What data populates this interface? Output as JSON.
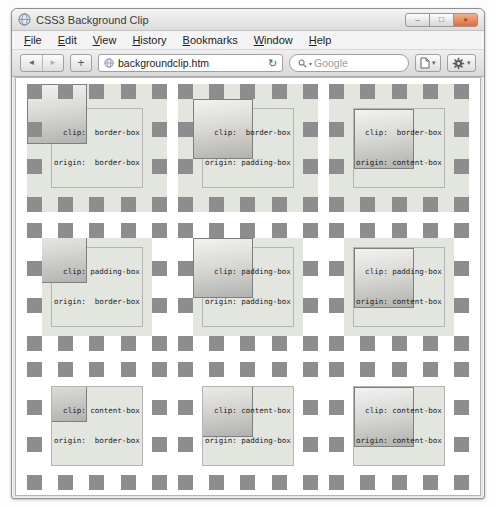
{
  "window": {
    "title": "CSS3 Background Clip",
    "controls": {
      "minimize": "–",
      "maximize": "□",
      "close": "×"
    }
  },
  "menubar": {
    "items": [
      "File",
      "Edit",
      "View",
      "History",
      "Bookmarks",
      "Window",
      "Help"
    ]
  },
  "toolbar": {
    "back_icon": "◄",
    "forward_icon": "►",
    "new_tab_label": "+",
    "url": "backgroundclip.htm",
    "reload_icon": "↻",
    "search_placeholder": "Google",
    "search_dropdown_icon": "▾",
    "page_menu_dropdown_icon": "▾",
    "settings_menu_dropdown_icon": "▾"
  },
  "demos": [
    {
      "clip": "border-box",
      "origin": "border-box",
      "label_line1": "  clip:  border-box",
      "label_line2": "origin:  border-box"
    },
    {
      "clip": "border-box",
      "origin": "padding-box",
      "label_line1": "  clip:  border-box",
      "label_line2": "origin: padding-box"
    },
    {
      "clip": "border-box",
      "origin": "content-box",
      "label_line1": "  clip:  border-box",
      "label_line2": "origin: content-box"
    },
    {
      "clip": "padding-box",
      "origin": "border-box",
      "label_line1": "  clip: padding-box",
      "label_line2": "origin:  border-box"
    },
    {
      "clip": "padding-box",
      "origin": "padding-box",
      "label_line1": "  clip: padding-box",
      "label_line2": "origin: padding-box"
    },
    {
      "clip": "padding-box",
      "origin": "content-box",
      "label_line1": "  clip: padding-box",
      "label_line2": "origin: content-box"
    },
    {
      "clip": "content-box",
      "origin": "border-box",
      "label_line1": "  clip: content-box",
      "label_line2": "origin:  border-box"
    },
    {
      "clip": "content-box",
      "origin": "padding-box",
      "label_line1": "  clip: content-box",
      "label_line2": "origin: padding-box"
    },
    {
      "clip": "content-box",
      "origin": "content-box",
      "label_line1": "  clip: content-box",
      "label_line2": "origin: content-box"
    }
  ],
  "colors": {
    "demo_background": "#e3e5df",
    "dash_gray": "#8d8d8d",
    "square_border": "#7f7f7f",
    "square_gradient_light": "#f2f2f0",
    "square_gradient_dark": "#b1b1ad",
    "content_outline": "#b4b4b4"
  }
}
